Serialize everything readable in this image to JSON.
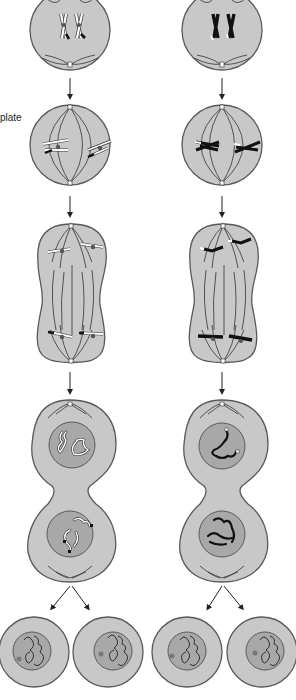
{
  "diagram": {
    "labels": {
      "partial_left_label": "plate"
    },
    "colors": {
      "cell_fill": "#c8c8c8",
      "cell_stroke": "#5a5a5a",
      "nucleus_fill": "#a8a8a8",
      "fiber": "#333333",
      "chromosome_white": "#ffffff",
      "chromosome_black": "#111111",
      "centromere": "#555555",
      "arrow": "#222222"
    },
    "columns": [
      {
        "name": "left-column",
        "chromosome_color": "white",
        "center_x": 70
      },
      {
        "name": "right-column",
        "chromosome_color": "black",
        "center_x": 222
      }
    ],
    "stages": [
      {
        "name": "prophase",
        "shape": "circle"
      },
      {
        "name": "metaphase",
        "shape": "circle-with-spindle"
      },
      {
        "name": "anaphase",
        "shape": "elongated-peanut"
      },
      {
        "name": "telophase",
        "shape": "figure-eight"
      },
      {
        "name": "daughter-cells",
        "shape": "four-circles"
      }
    ]
  }
}
